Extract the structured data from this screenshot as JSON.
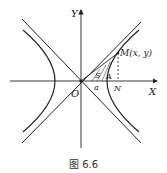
{
  "figure": {
    "caption": "图 6.6",
    "labels": {
      "y_axis": "Y",
      "x_axis": "X",
      "origin": "O",
      "point_m": "M(x, y)",
      "point_n": "N",
      "point_a": "A",
      "area": "S",
      "semi_axis": "a"
    }
  }
}
